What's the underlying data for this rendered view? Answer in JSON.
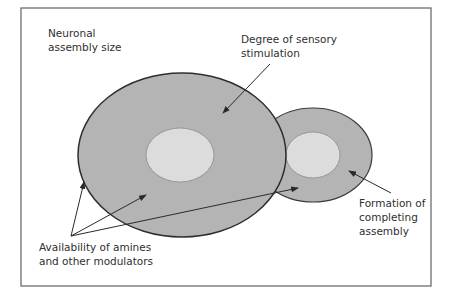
{
  "diagram": {
    "colors": {
      "frame_stroke": "#6e6e6e",
      "assembly_fill": "#b4b4b4",
      "core_fill": "#dcdcdc",
      "outline": "#2e2e2e",
      "text": "#2f2f2f"
    },
    "shapes": {
      "main_assembly": {
        "cx": 182,
        "cy": 155,
        "rx": 104,
        "ry": 82
      },
      "main_core": {
        "cx": 180,
        "cy": 155,
        "rx": 34,
        "ry": 27
      },
      "completing_assembly": {
        "cx": 313,
        "cy": 155,
        "rx": 59,
        "ry": 47
      },
      "completing_core": {
        "cx": 313,
        "cy": 155,
        "rx": 27,
        "ry": 23
      }
    },
    "labels": {
      "neuronal_assembly_size": {
        "lines": [
          "Neuronal",
          "assembly size"
        ]
      },
      "sensory_stimulation": {
        "lines": [
          "Degree of sensory",
          "stimulation"
        ]
      },
      "completing_assembly": {
        "lines": [
          "Formation of",
          "completing",
          "assembly"
        ]
      },
      "amines_modulators": {
        "lines": [
          "Availability of amines",
          "and other modulators"
        ]
      }
    },
    "arrows": [
      {
        "name": "sensory-stimulation-arrow",
        "from": [
          270,
          64
        ],
        "to": [
          223,
          113
        ]
      },
      {
        "name": "completing-assembly-arrow",
        "from": [
          391,
          193
        ],
        "to": [
          349,
          171
        ]
      },
      {
        "name": "modulators-arrow-edge",
        "from": [
          71,
          236
        ],
        "to": [
          84,
          182
        ]
      },
      {
        "name": "modulators-arrow-main",
        "from": [
          71,
          236
        ],
        "to": [
          146,
          195
        ]
      },
      {
        "name": "modulators-arrow-completing",
        "from": [
          71,
          236
        ],
        "to": [
          298,
          188
        ]
      }
    ]
  }
}
